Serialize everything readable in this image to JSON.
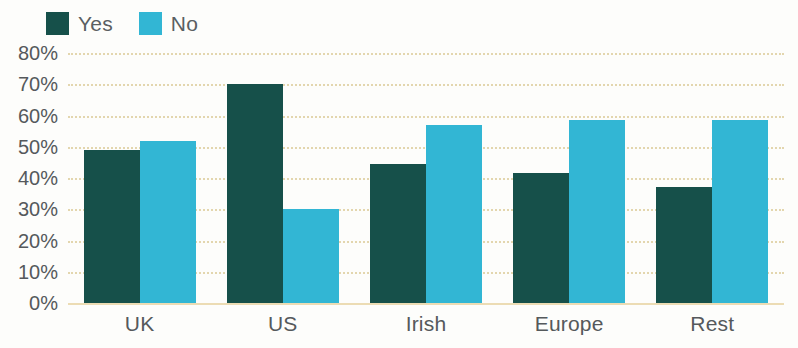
{
  "legend": {
    "items": [
      {
        "label": "Yes",
        "color": "#16504A",
        "swatch_name": "legend-swatch-yes"
      },
      {
        "label": "No",
        "color": "#32B6D4",
        "swatch_name": "legend-swatch-no"
      }
    ]
  },
  "axis": {
    "y_ticks": [
      "80%",
      "70%",
      "60%",
      "50%",
      "40%",
      "30%",
      "20%",
      "10%",
      "0%"
    ],
    "x_ticks": [
      "UK",
      "US",
      "Irish",
      "Europe",
      "Rest"
    ]
  },
  "colors": {
    "yes": "#16504A",
    "no": "#32B6D4",
    "gridline": "#E3D6AE",
    "text": "#55595C",
    "background": "#FDFDFB"
  },
  "chart_data": {
    "type": "bar",
    "title": "",
    "xlabel": "",
    "ylabel": "",
    "ylim": [
      0,
      80
    ],
    "ytick_step": 10,
    "ytick_format": "percent",
    "grid": true,
    "legend_position": "top-left",
    "orientation": "vertical",
    "grouping": "grouped",
    "categories": [
      "UK",
      "US",
      "Irish",
      "Europe",
      "Rest"
    ],
    "series": [
      {
        "name": "Yes",
        "color": "#16504A",
        "values": [
          49,
          70,
          44.5,
          41.5,
          37
        ]
      },
      {
        "name": "No",
        "color": "#32B6D4",
        "values": [
          52,
          30,
          57,
          58.5,
          58.5
        ]
      }
    ]
  }
}
